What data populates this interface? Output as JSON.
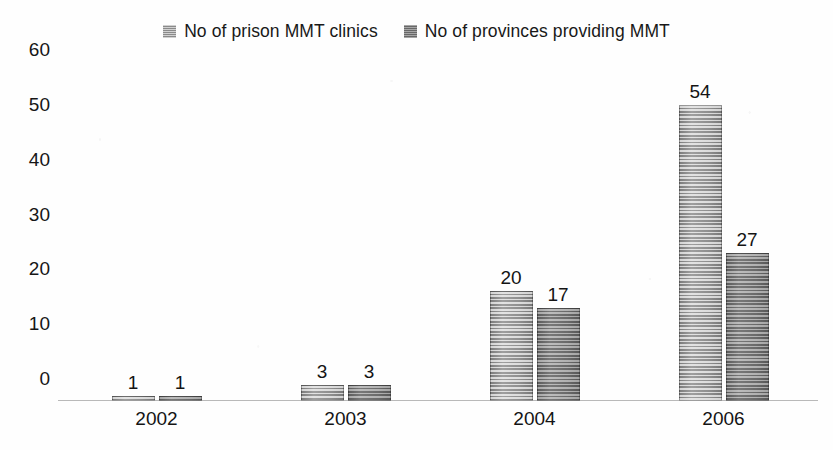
{
  "chart_data": {
    "type": "bar",
    "title": "",
    "subtitle": "",
    "xlabel": "",
    "ylabel": "",
    "categories": [
      "2002",
      "2003",
      "2004",
      "2006"
    ],
    "series": [
      {
        "name": "No of prison MMT clinics",
        "values": [
          1,
          3,
          20,
          54
        ],
        "color": "#a2a2a2"
      },
      {
        "name": "No of provinces providing MMT",
        "values": [
          1,
          3,
          17,
          27
        ],
        "color": "#7e7e7e"
      }
    ],
    "yticks": [
      0,
      10,
      20,
      30,
      40,
      50,
      60
    ],
    "ylim": [
      0,
      60
    ],
    "grid": false,
    "legend_position": "top-center",
    "data_labels": true
  },
  "legend": {
    "items": [
      {
        "label": "No of prison MMT clinics",
        "swatch": "legend-swatch-series-1"
      },
      {
        "label": "No of provinces providing MMT",
        "swatch": "legend-swatch-series-2"
      }
    ]
  },
  "axes": {
    "y_tick_labels": [
      "60",
      "50",
      "40",
      "30",
      "20",
      "10",
      "0"
    ],
    "x_tick_labels": [
      "2002",
      "2003",
      "2004",
      "2006"
    ]
  }
}
